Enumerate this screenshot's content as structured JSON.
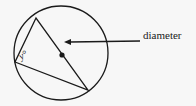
{
  "diagram": {
    "angle_label": "y°",
    "pointer_label": "diameter",
    "colors": {
      "stroke": "#1a1a1a",
      "background": "#f7f7f7"
    }
  }
}
